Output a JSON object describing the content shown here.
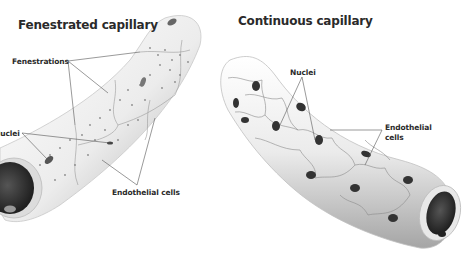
{
  "diagram": {
    "left": {
      "title": "Fenestrated capillary",
      "labels": {
        "fenestrations": "Fenestrations",
        "nuclei": "Nuclei",
        "endothelial_cells": "Endothelial cells"
      }
    },
    "right": {
      "title": "Continuous capillary",
      "labels": {
        "nuclei": "Nuclei",
        "endothelial_cells_line1": "Endothelial",
        "endothelial_cells_line2": "cells"
      }
    },
    "colors": {
      "vessel_fill": "#efefef",
      "vessel_shade": "#b5b5b5",
      "lumen": "#2b2b2b",
      "nucleus": "#333333",
      "cell_border": "#8a8a8a",
      "leader_line": "#555555"
    }
  }
}
